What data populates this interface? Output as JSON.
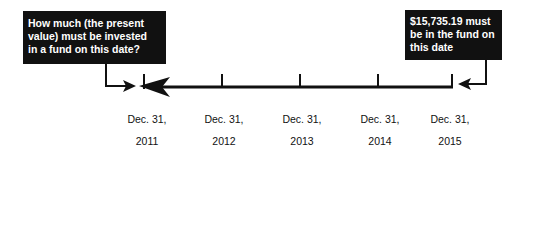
{
  "left_callout": {
    "lines": [
      "How much (the present",
      "value) must be invested",
      "in a fund on this date?"
    ]
  },
  "right_callout": {
    "lines": [
      "$15,735.19 must",
      "be in the fund on",
      "this date"
    ]
  },
  "timeline": {
    "direction": "right-to-left",
    "points": [
      {
        "line1": "Dec. 31,",
        "line2": "2011"
      },
      {
        "line1": "Dec. 31,",
        "line2": "2012"
      },
      {
        "line1": "Dec. 31,",
        "line2": "2013"
      },
      {
        "line1": "Dec. 31,",
        "line2": "2014"
      },
      {
        "line1": "Dec. 31,",
        "line2": "2015"
      }
    ]
  },
  "colors": {
    "box_bg": "#111111",
    "box_text": "#ffffff",
    "line": "#111111"
  }
}
